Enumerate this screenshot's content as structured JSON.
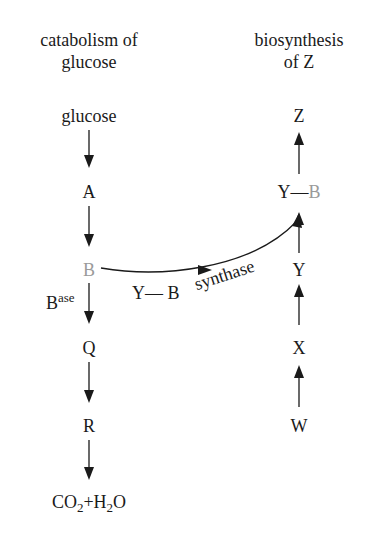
{
  "left_column": {
    "heading_line1": "catabolism of",
    "heading_line2": "glucose",
    "nodes": [
      "glucose",
      "A",
      "B",
      "Q",
      "R"
    ],
    "end_product": {
      "co": "CO",
      "sub1": "2",
      "plus": "+",
      "h": "H",
      "sub2": "2",
      "o": "O"
    },
    "enzyme_label": {
      "base": "B",
      "sup": "ase"
    }
  },
  "right_column": {
    "heading_line1": "biosynthesis",
    "heading_line2": "of Z",
    "nodes": [
      "Z",
      "Y",
      "X",
      "W"
    ],
    "complex": {
      "left": "Y",
      "dash": "—",
      "right": "B"
    }
  },
  "connector": {
    "label_left": "Y— B",
    "label_right": "synthase"
  },
  "colors": {
    "text": "#1a1a1a",
    "highlight_gray": "#9a9a9a",
    "background": "#ffffff"
  }
}
